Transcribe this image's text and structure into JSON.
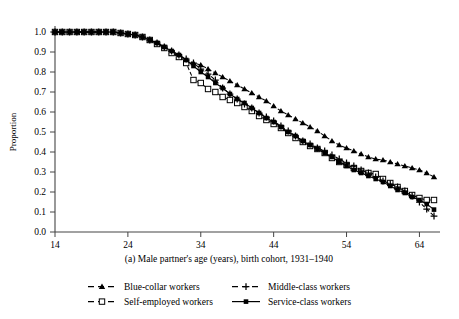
{
  "chart_data": {
    "type": "line",
    "title": "",
    "caption": "(a) Male partner's age (years), birth cohort, 1931–1940",
    "xlabel": "",
    "ylabel": "Proportion",
    "xlim": [
      14,
      66
    ],
    "ylim": [
      0.0,
      1.0
    ],
    "grid": false,
    "legend_position": "bottom",
    "xticks": [
      14,
      24,
      34,
      44,
      54,
      64
    ],
    "xtick_labels": [
      "14",
      "24",
      "34",
      "44",
      "54",
      "64"
    ],
    "yticks": [
      0.0,
      0.1,
      0.2,
      0.3,
      0.4,
      0.5,
      0.6,
      0.7,
      0.8,
      0.9,
      1.0
    ],
    "ytick_labels": [
      "0.0",
      "0.1",
      "0.2",
      "0.3",
      "0.4",
      "0.5",
      "0.6",
      "0.7",
      "0.8",
      "0.9",
      "1.0"
    ],
    "x": [
      14,
      15,
      16,
      17,
      18,
      19,
      20,
      21,
      22,
      23,
      24,
      25,
      26,
      27,
      28,
      29,
      30,
      31,
      32,
      33,
      34,
      35,
      36,
      37,
      38,
      39,
      40,
      41,
      42,
      43,
      44,
      45,
      46,
      47,
      48,
      49,
      50,
      51,
      52,
      53,
      54,
      55,
      56,
      57,
      58,
      59,
      60,
      61,
      62,
      63,
      64,
      65,
      66
    ],
    "series": [
      {
        "name": "Blue-collar workers",
        "marker": "filled-triangle",
        "linestyle": "dashed",
        "color": "#000000",
        "values": [
          1.0,
          1.0,
          1.0,
          1.0,
          1.0,
          1.0,
          1.0,
          1.0,
          1.0,
          0.995,
          0.99,
          0.985,
          0.975,
          0.96,
          0.945,
          0.925,
          0.9,
          0.875,
          0.855,
          0.845,
          0.835,
          0.815,
          0.795,
          0.775,
          0.755,
          0.735,
          0.715,
          0.695,
          0.675,
          0.655,
          0.63,
          0.605,
          0.585,
          0.565,
          0.545,
          0.525,
          0.505,
          0.48,
          0.455,
          0.435,
          0.42,
          0.405,
          0.39,
          0.375,
          0.365,
          0.36,
          0.35,
          0.34,
          0.33,
          0.32,
          0.31,
          0.295,
          0.275
        ]
      },
      {
        "name": "Self-employed workers",
        "marker": "open-square",
        "linestyle": "dashed",
        "color": "#000000",
        "values": [
          1.0,
          1.0,
          1.0,
          1.0,
          1.0,
          1.0,
          1.0,
          1.0,
          1.0,
          0.995,
          0.99,
          0.985,
          0.975,
          0.96,
          0.94,
          0.92,
          0.895,
          0.875,
          0.845,
          0.76,
          0.745,
          0.715,
          0.7,
          0.675,
          0.66,
          0.645,
          0.625,
          0.605,
          0.58,
          0.56,
          0.54,
          0.52,
          0.495,
          0.47,
          0.45,
          0.43,
          0.415,
          0.395,
          0.37,
          0.35,
          0.335,
          0.32,
          0.305,
          0.295,
          0.29,
          0.265,
          0.245,
          0.225,
          0.205,
          0.185,
          0.17,
          0.16,
          0.16
        ]
      },
      {
        "name": "Middle-class workers",
        "marker": "plus",
        "linestyle": "dashed",
        "color": "#000000",
        "values": [
          1.0,
          1.0,
          1.0,
          1.0,
          1.0,
          1.0,
          1.0,
          1.0,
          1.0,
          0.995,
          0.99,
          0.985,
          0.975,
          0.96,
          0.945,
          0.925,
          0.905,
          0.885,
          0.865,
          0.845,
          0.815,
          0.79,
          0.76,
          0.72,
          0.69,
          0.665,
          0.64,
          0.62,
          0.595,
          0.575,
          0.555,
          0.53,
          0.505,
          0.48,
          0.455,
          0.44,
          0.42,
          0.405,
          0.385,
          0.365,
          0.345,
          0.33,
          0.31,
          0.295,
          0.275,
          0.255,
          0.24,
          0.225,
          0.205,
          0.18,
          0.15,
          0.115,
          0.08
        ]
      },
      {
        "name": "Service-class workers",
        "marker": "filled-square",
        "linestyle": "solid",
        "color": "#000000",
        "values": [
          1.0,
          1.0,
          1.0,
          1.0,
          1.0,
          1.0,
          1.0,
          1.0,
          1.0,
          0.995,
          0.99,
          0.985,
          0.975,
          0.96,
          0.945,
          0.925,
          0.905,
          0.885,
          0.86,
          0.83,
          0.8,
          0.775,
          0.745,
          0.72,
          0.69,
          0.665,
          0.645,
          0.62,
          0.595,
          0.57,
          0.55,
          0.525,
          0.5,
          0.48,
          0.455,
          0.435,
          0.415,
          0.395,
          0.375,
          0.35,
          0.33,
          0.31,
          0.295,
          0.28,
          0.265,
          0.25,
          0.23,
          0.21,
          0.195,
          0.175,
          0.16,
          0.14,
          0.112
        ]
      }
    ]
  },
  "legend": {
    "entries": [
      {
        "label": "Blue-collar workers",
        "marker": "filled-triangle",
        "linestyle": "dashed"
      },
      {
        "label": "Middle-class workers",
        "marker": "plus",
        "linestyle": "dashed"
      },
      {
        "label": "Self-employed workers",
        "marker": "open-square",
        "linestyle": "dashed"
      },
      {
        "label": "Service-class workers",
        "marker": "filled-square",
        "linestyle": "solid"
      }
    ]
  }
}
